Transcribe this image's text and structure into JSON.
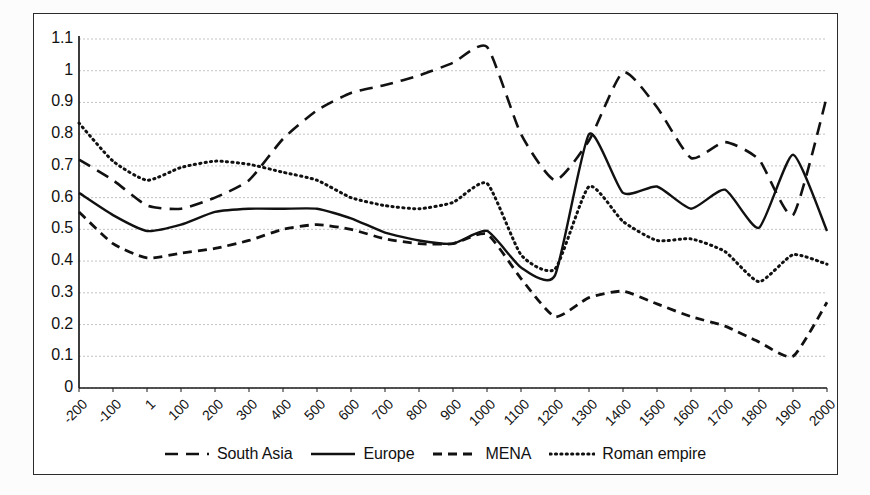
{
  "chart_data": {
    "type": "line",
    "title": "",
    "xlabel": "",
    "ylabel": "",
    "xlim": [
      -200,
      2000
    ],
    "ylim": [
      0,
      1.1
    ],
    "grid": true,
    "legend_position": "bottom",
    "categories": [
      "-200",
      "-100",
      "1",
      "100",
      "200",
      "300",
      "400",
      "500",
      "600",
      "700",
      "800",
      "900",
      "1000",
      "1100",
      "1200",
      "1300",
      "1400",
      "1500",
      "1600",
      "1700",
      "1800",
      "1900",
      "2000"
    ],
    "ytick_labels": [
      "0",
      "0.1",
      "0.2",
      "0.3",
      "0.4",
      "0.5",
      "0.6",
      "0.7",
      "0.8",
      "0.9",
      "1",
      "1.1"
    ],
    "ytick_values": [
      0,
      0.1,
      0.2,
      0.3,
      0.4,
      0.5,
      0.6,
      0.7,
      0.8,
      0.9,
      1,
      1.1
    ],
    "series": [
      {
        "name": "South Asia",
        "style": "long-dash",
        "color": "#111111",
        "values": [
          0.72,
          0.655,
          0.575,
          0.565,
          0.6,
          0.655,
          0.785,
          0.875,
          0.93,
          0.955,
          0.985,
          1.025,
          1.075,
          0.8,
          0.655,
          0.78,
          0.995,
          0.885,
          0.725,
          0.775,
          0.72,
          0.545,
          0.92
        ]
      },
      {
        "name": "Europe",
        "style": "solid",
        "color": "#111111",
        "values": [
          0.615,
          0.545,
          0.495,
          0.515,
          0.555,
          0.565,
          0.565,
          0.565,
          0.535,
          0.49,
          0.465,
          0.455,
          0.495,
          0.38,
          0.355,
          0.8,
          0.615,
          0.635,
          0.565,
          0.625,
          0.505,
          0.735,
          0.495
        ]
      },
      {
        "name": "MENA",
        "style": "short-dash",
        "color": "#111111",
        "values": [
          0.555,
          0.455,
          0.41,
          0.425,
          0.44,
          0.465,
          0.5,
          0.515,
          0.5,
          0.47,
          0.455,
          0.455,
          0.485,
          0.345,
          0.225,
          0.285,
          0.305,
          0.265,
          0.225,
          0.195,
          0.145,
          0.1,
          0.27
        ]
      },
      {
        "name": "Roman empire",
        "style": "dotted",
        "color": "#111111",
        "values": [
          0.835,
          0.715,
          0.655,
          0.695,
          0.715,
          0.705,
          0.68,
          0.655,
          0.6,
          0.575,
          0.565,
          0.585,
          0.645,
          0.42,
          0.375,
          0.635,
          0.525,
          0.465,
          0.47,
          0.43,
          0.335,
          0.42,
          0.39
        ]
      }
    ]
  },
  "legend": {
    "items": [
      {
        "label": "South Asia",
        "style": "long-dash"
      },
      {
        "label": "Europe",
        "style": "solid"
      },
      {
        "label": "MENA",
        "style": "short-dash"
      },
      {
        "label": "Roman empire",
        "style": "dotted"
      }
    ]
  }
}
